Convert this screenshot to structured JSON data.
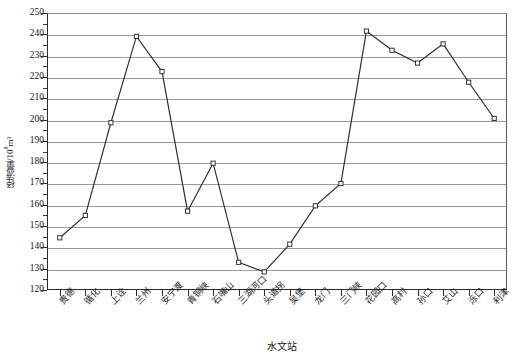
{
  "chart_data": {
    "type": "line",
    "title": "",
    "xlabel": "水文站",
    "ylabel": "径流量/10⁸m³",
    "ylabel_base": "径流量/10",
    "ylabel_exp": "8",
    "ylabel_unit": "m³",
    "ylim": [
      120,
      250
    ],
    "ytick_step": 10,
    "yticks": [
      120,
      130,
      140,
      150,
      160,
      170,
      180,
      190,
      200,
      210,
      220,
      230,
      240,
      250
    ],
    "ytick_labels": [
      "120",
      "130",
      "140",
      "150",
      "160",
      "170",
      "180",
      "190",
      "200",
      "210",
      "220",
      "230",
      "240",
      "250"
    ],
    "grid": true,
    "grid_axis": "y",
    "legend": false,
    "legend_position": "none",
    "marker": "open-square",
    "line_color": "#2b2b2b",
    "marker_face_color": "#ffffff",
    "marker_edge_color": "#2b2b2b",
    "grid_color": "#9a9a9a",
    "axis_color": "#2b2b2b",
    "categories": [
      "贵德",
      "循化",
      "上诠",
      "兰州",
      "安宁渡",
      "青铜峡",
      "石嘴山",
      "三湖河口",
      "头道拐",
      "吴堡",
      "龙门",
      "三门峡",
      "花园口",
      "高村",
      "孙口",
      "艾山",
      "泺口",
      "利津"
    ],
    "values": [
      144.5,
      155.0,
      198.5,
      239.0,
      222.5,
      157.0,
      179.5,
      133.0,
      128.5,
      141.5,
      159.5,
      170.0,
      241.5,
      232.5,
      226.5,
      235.5,
      217.5,
      200.5
    ],
    "series": [
      {
        "name": "径流量",
        "values": [
          144.5,
          155.0,
          198.5,
          239.0,
          222.5,
          157.0,
          179.5,
          133.0,
          128.5,
          141.5,
          159.5,
          170.0,
          241.5,
          232.5,
          226.5,
          235.5,
          217.5,
          200.5
        ]
      }
    ]
  }
}
